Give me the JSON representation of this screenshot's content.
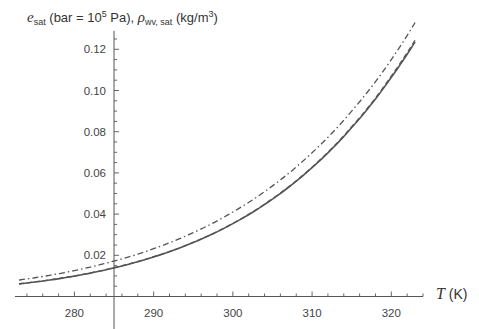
{
  "chart_data": {
    "type": "line",
    "title": "",
    "xlabel": "T (K)",
    "ylabel": "e_sat (bar = 10^5 Pa), ρ_wv, sat (kg/m^3)",
    "xlim": [
      272.5,
      324
    ],
    "ylim": [
      0,
      0.127
    ],
    "x_axis_crossing": 285,
    "grid": false,
    "legend": null,
    "x_ticks": [
      280,
      290,
      300,
      310,
      320
    ],
    "y_ticks": [
      0.02,
      0.04,
      0.06,
      0.08,
      0.1,
      0.12
    ],
    "y_tick_labels": [
      "0.02",
      "0.04",
      "0.06",
      "0.08",
      "0.10",
      "0.12"
    ],
    "x": [
      273,
      275,
      280,
      285,
      290,
      295,
      300,
      305,
      310,
      315,
      320,
      323
    ],
    "series": [
      {
        "name": "solid",
        "style": "solid",
        "color": "#555555",
        "values": [
          0.0061,
          0.007,
          0.0099,
          0.0139,
          0.0192,
          0.0262,
          0.0354,
          0.0473,
          0.0626,
          0.082,
          0.1064,
          0.1236
        ]
      },
      {
        "name": "dashed",
        "style": "dashed",
        "color": "#555555",
        "values": [
          0.0062,
          0.0071,
          0.01,
          0.014,
          0.0193,
          0.0263,
          0.0355,
          0.0475,
          0.0628,
          0.0824,
          0.107,
          0.1245
        ]
      },
      {
        "name": "dash-dot",
        "style": "dashdot",
        "color": "#555555",
        "values": [
          0.008,
          0.0091,
          0.0126,
          0.0172,
          0.0232,
          0.031,
          0.041,
          0.0537,
          0.0698,
          0.09,
          0.115,
          0.133
        ]
      }
    ]
  },
  "labels": {
    "y_main": "e",
    "y_main_sub": "sat",
    "y_part1": " (bar = 10",
    "y_sup1": "5",
    "y_part2": " Pa), ",
    "y_rho": "ρ",
    "y_rho_sub": "wv, sat",
    "y_part3": " (kg/m",
    "y_sup2": "3",
    "y_part4": ")",
    "x_var": "T",
    "x_unit": " (K)"
  }
}
